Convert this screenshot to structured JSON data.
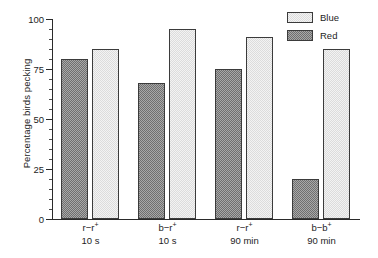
{
  "chart_data": {
    "type": "bar",
    "title": "",
    "xlabel": "",
    "ylabel": "Percentage birds pecking",
    "ylim": [
      0,
      100
    ],
    "yticks": [
      0,
      25,
      50,
      75,
      100
    ],
    "ytick_labels": [
      "0",
      "25",
      "50",
      "75",
      "100"
    ],
    "minor_tick_step": 5,
    "grid": false,
    "legend_position": "top-right",
    "categories": [
      {
        "line1_base": "r",
        "line1_dash": "−",
        "line1_second": "r",
        "line1_sup": "+",
        "line2": "10 s"
      },
      {
        "line1_base": "b",
        "line1_dash": "−",
        "line1_second": "r",
        "line1_sup": "+",
        "line2": "10 s"
      },
      {
        "line1_base": "r",
        "line1_dash": "−",
        "line1_second": "r",
        "line1_sup": "+",
        "line2": "90 min"
      },
      {
        "line1_base": "b",
        "line1_dash": "−",
        "line1_second": "b",
        "line1_sup": "+",
        "line2": "90 min"
      }
    ],
    "series": [
      {
        "name": "Red",
        "color": "#8d8d8d",
        "values": [
          80,
          68,
          75,
          20
        ]
      },
      {
        "name": "Blue",
        "color": "#e4e4e4",
        "values": [
          85,
          95,
          91,
          85
        ]
      }
    ]
  },
  "legend": {
    "entries": [
      {
        "label": "Blue",
        "key": "blue"
      },
      {
        "label": "Red",
        "key": "red"
      }
    ]
  }
}
